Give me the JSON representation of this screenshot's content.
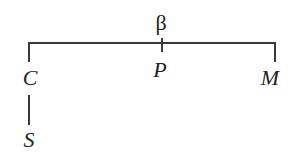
{
  "diagram": {
    "type": "tree",
    "root": {
      "label": "β"
    },
    "children": [
      {
        "label": "C",
        "children": [
          {
            "label": "S"
          }
        ]
      },
      {
        "label": "P",
        "children": []
      },
      {
        "label": "M",
        "children": []
      }
    ],
    "edges": [
      {
        "from": "β",
        "to": "C"
      },
      {
        "from": "β",
        "to": "P"
      },
      {
        "from": "β",
        "to": "M"
      },
      {
        "from": "C",
        "to": "S"
      }
    ],
    "colors": {
      "line": "#3a3a3a",
      "text": "#222222",
      "background": "#ffffff"
    }
  }
}
